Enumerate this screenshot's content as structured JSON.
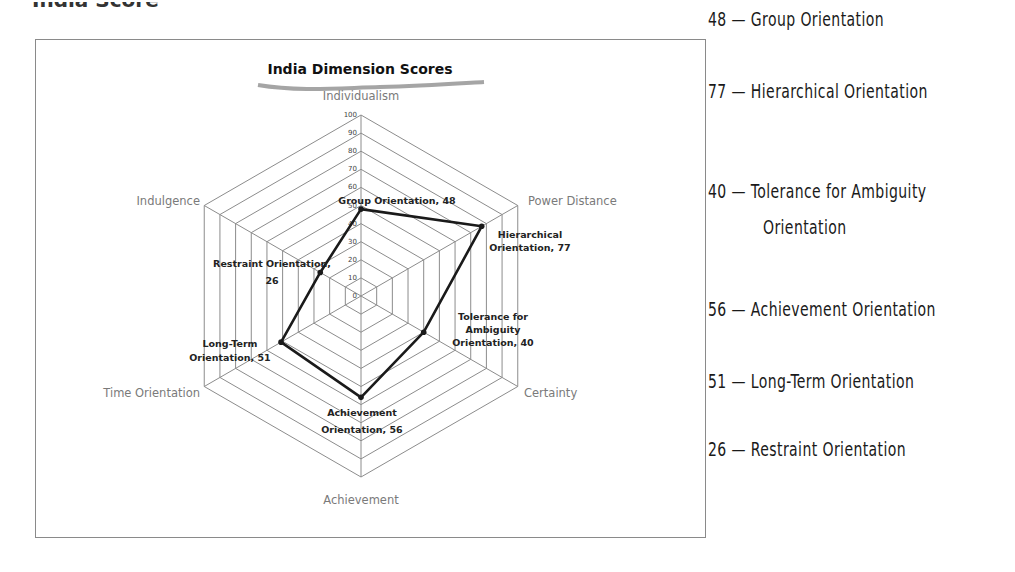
{
  "page": {
    "top_cut_text": "India Score"
  },
  "chart_data": {
    "type": "radar",
    "title": "India Dimension Scores",
    "axes": [
      "Individualism",
      "Power Distance",
      "Certainty",
      "Achievement",
      "Time Orientation",
      "Indulgence"
    ],
    "series": [
      {
        "name": "India",
        "values": [
          48,
          77,
          40,
          56,
          51,
          26
        ],
        "point_labels": [
          "Group Orientation, 48",
          "Hierarchical Orientation, 77",
          "Tolerance for Ambiguity Orientation, 40",
          "Achievement Orientation, 56",
          "Long-Term Orientation, 51",
          "Restraint Orientation, 26"
        ]
      }
    ],
    "rlim": [
      0,
      100
    ],
    "rticks": [
      0,
      10,
      20,
      30,
      40,
      50,
      60,
      70,
      80,
      90,
      100
    ],
    "grid": true,
    "legend": "none"
  },
  "chart": {
    "title": "India Dimension Scores",
    "axis_labels": {
      "top": "Individualism",
      "upper_right": "Power Distance",
      "lower_right": "Certainty",
      "bottom": "Achievement",
      "lower_left": "Time Orientation",
      "upper_left": "Indulgence"
    },
    "ticks": [
      "0",
      "10",
      "20",
      "30",
      "40",
      "50",
      "60",
      "70",
      "80",
      "90",
      "100"
    ],
    "data_labels": {
      "group": "Group Orientation, 48",
      "hier_1": "Hierarchical",
      "hier_2": "Orientation, 77",
      "tol_1": "Tolerance for",
      "tol_2": "Ambiguity",
      "tol_3": "Orientation, 40",
      "ach_1": "Achievement",
      "ach_2": "Orientation, 56",
      "lt_1": "Long-Term",
      "lt_2": "Orientation, 51",
      "res_1": "Restraint Orientation,",
      "res_2": "26"
    }
  },
  "score_list": [
    {
      "score": "48",
      "dash": "—",
      "label": "Group Orientation"
    },
    {
      "score": "77",
      "dash": "—",
      "label": "Hierarchical Orientation"
    },
    {
      "score": "40",
      "dash": "—",
      "label": "Tolerance for Ambiguity",
      "label_cont": "Orientation"
    },
    {
      "score": "56",
      "dash": "—",
      "label": "Achievement Orientation"
    },
    {
      "score": "51",
      "dash": "—",
      "label": "Long-Term Orientation"
    },
    {
      "score": "26",
      "dash": "—",
      "label": "Restraint Orientation"
    }
  ],
  "colors": {
    "grid": "#8c8c8c",
    "series_line": "#1a1a1a",
    "axis_label": "#7a7a7a",
    "frame": "#8a8a8a"
  }
}
